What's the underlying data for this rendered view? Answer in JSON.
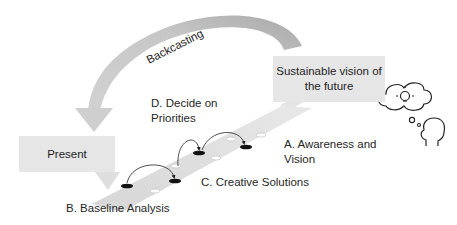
{
  "diagram": {
    "colors": {
      "arc": "#bdbdbd",
      "box": "#e6e6e6",
      "strip": "#dcdcdc",
      "marker_filled": "#111111",
      "marker_open": "#ffffff",
      "text": "#222222"
    },
    "arc_label": "Backcasting",
    "present_box": {
      "label": "Present"
    },
    "future_box": {
      "line1": "Sustainable vision of",
      "line2": "the future"
    },
    "steps": {
      "a": {
        "line1": "A. Awareness and",
        "line2": "Vision"
      },
      "b": {
        "label": "B. Baseline Analysis"
      },
      "c": {
        "label": "C. Creative Solutions"
      },
      "d": {
        "line1": "D. Decide on",
        "line2": "Priorities"
      }
    },
    "icons": [
      "lightbulb-cloud-icon",
      "thought-bubble-icon",
      "head-silhouette-icon"
    ]
  }
}
